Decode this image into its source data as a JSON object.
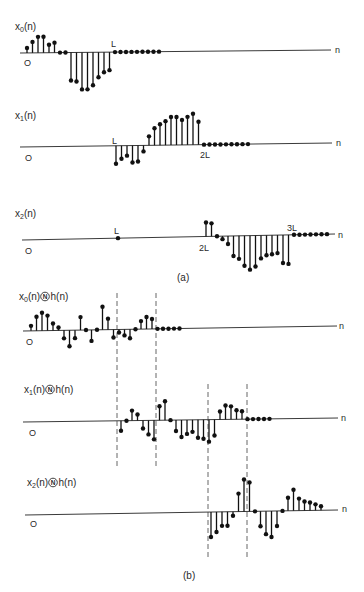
{
  "figure": {
    "axis_variable": "n",
    "part_a_caption": "(a)",
    "part_b_caption": "(b)",
    "operator_symbol": "N",
    "ink_color": "#111111",
    "background_color": "#ffffff"
  },
  "chart_data": [
    {
      "type": "stem",
      "panel": "a",
      "title": "x0(n)",
      "label": {
        "base": "x",
        "sub": "0",
        "arg": "(n)"
      },
      "xlabel": "n",
      "n_start": 0,
      "values": [
        5,
        11,
        16,
        16,
        8,
        10,
        0,
        0,
        -28,
        -29,
        -37,
        -37,
        -33,
        -25,
        -20,
        -18
      ],
      "trailing_zero_samples": 9,
      "ticks": [
        {
          "n": 0,
          "label": "O"
        },
        {
          "n": 16,
          "label": "L"
        }
      ]
    },
    {
      "type": "stem",
      "panel": "a",
      "title": "x1(n)",
      "label": {
        "base": "x",
        "sub": "1",
        "arg": "(n)"
      },
      "xlabel": "n",
      "n_start": 16,
      "values": [
        -18,
        -13,
        -10,
        -17,
        -16,
        -6,
        9,
        17,
        21,
        24,
        28,
        28,
        25,
        28,
        31,
        23
      ],
      "trailing_zero_samples": 9,
      "ticks": [
        {
          "n": 0,
          "label": "O"
        },
        {
          "n": 16,
          "label": "L"
        },
        {
          "n": 32,
          "label": "2L"
        }
      ]
    },
    {
      "type": "stem",
      "panel": "a",
      "title": "x2(n)",
      "label": {
        "base": "x",
        "sub": "2",
        "arg": "(n)"
      },
      "xlabel": "n",
      "n_start": 32,
      "values": [
        14,
        13,
        0,
        -3,
        -8,
        -20,
        -23,
        -30,
        -34,
        -31,
        -23,
        -20,
        -19,
        -18,
        -28,
        -29
      ],
      "trailing_zero_samples": 7,
      "marker_dots": [
        16
      ],
      "ticks": [
        {
          "n": 0,
          "label": "O"
        },
        {
          "n": 16,
          "label": "L"
        },
        {
          "n": 32,
          "label": "2L"
        },
        {
          "n": 48,
          "label": "3L"
        }
      ]
    },
    {
      "type": "stem",
      "panel": "b",
      "title": "x0(n) (N) h(n)",
      "label": {
        "base": "x",
        "sub": "0",
        "arg": "(n)",
        "op": "N",
        "tail": "h(n)"
      },
      "xlabel": "n",
      "n_start": 0,
      "values": [
        5,
        14,
        18,
        15,
        7,
        3,
        -8,
        -16,
        -8,
        13,
        0,
        -11,
        0,
        23,
        11,
        -8,
        -3,
        -6,
        -9,
        0,
        8,
        12,
        10
      ],
      "trailing_zero_samples": 5,
      "ticks": [
        {
          "n": 0,
          "label": "O"
        }
      ],
      "dashed_boundaries_n": [
        16,
        23
      ]
    },
    {
      "type": "stem",
      "panel": "b",
      "title": "x1(n) (N) h(n)",
      "label": {
        "base": "x",
        "sub": "1",
        "arg": "(n)",
        "op": "N",
        "tail": "h(n)"
      },
      "xlabel": "n",
      "n_start": 16,
      "values": [
        -10,
        0,
        10,
        6,
        -8,
        -14,
        -19,
        14,
        19,
        0,
        -11,
        -17,
        -14,
        -12,
        -18,
        -19,
        -22,
        -16,
        8,
        14,
        13,
        9,
        8
      ],
      "trailing_zero_samples": 5,
      "ticks": [
        {
          "n": 0,
          "label": "O"
        }
      ],
      "dashed_boundaries_n": [
        16,
        23,
        32,
        39
      ]
    },
    {
      "type": "stem",
      "panel": "b",
      "title": "x2(n) (N) h(n)",
      "label": {
        "base": "x",
        "sub": "2",
        "arg": "(n)",
        "op": "N",
        "tail": "h(n)"
      },
      "xlabel": "n",
      "n_start": 32,
      "values": [
        -25,
        -20,
        -14,
        -14,
        -4,
        18,
        32,
        29,
        0,
        -15,
        -23,
        -26,
        -15,
        0,
        13,
        21,
        12,
        9,
        8,
        6,
        4
      ],
      "trailing_zero_samples": 0,
      "ticks": [
        {
          "n": 0,
          "label": "O"
        }
      ],
      "dashed_boundaries_n": [
        32,
        39
      ]
    }
  ]
}
